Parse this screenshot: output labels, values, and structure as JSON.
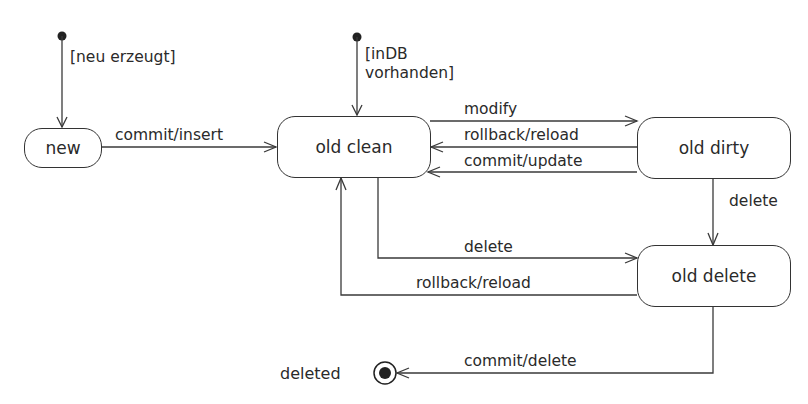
{
  "diagram": {
    "type": "UML state diagram",
    "states": [
      {
        "id": "new",
        "label": "new"
      },
      {
        "id": "old_clean",
        "label": "old clean"
      },
      {
        "id": "old_dirty",
        "label": "old dirty"
      },
      {
        "id": "old_delete",
        "label": "old delete"
      }
    ],
    "initial_states": [
      {
        "target": "new",
        "guard": "[neu erzeugt]"
      },
      {
        "target": "old_clean",
        "guard_line1": "[inDB",
        "guard_line2": "vorhanden]"
      }
    ],
    "final_state": {
      "label": "deleted"
    },
    "transitions": [
      {
        "from": "new",
        "to": "old_clean",
        "label": "commit/insert"
      },
      {
        "from": "old_clean",
        "to": "old_dirty",
        "label": "modify"
      },
      {
        "from": "old_dirty",
        "to": "old_clean",
        "label": "rollback/reload"
      },
      {
        "from": "old_dirty",
        "to": "old_clean",
        "label": "commit/update"
      },
      {
        "from": "old_dirty",
        "to": "old_delete",
        "label": "delete"
      },
      {
        "from": "old_clean",
        "to": "old_delete",
        "label": "delete"
      },
      {
        "from": "old_delete",
        "to": "old_clean",
        "label": "rollback/reload"
      },
      {
        "from": "old_delete",
        "to": "deleted",
        "label": "commit/delete"
      }
    ]
  }
}
